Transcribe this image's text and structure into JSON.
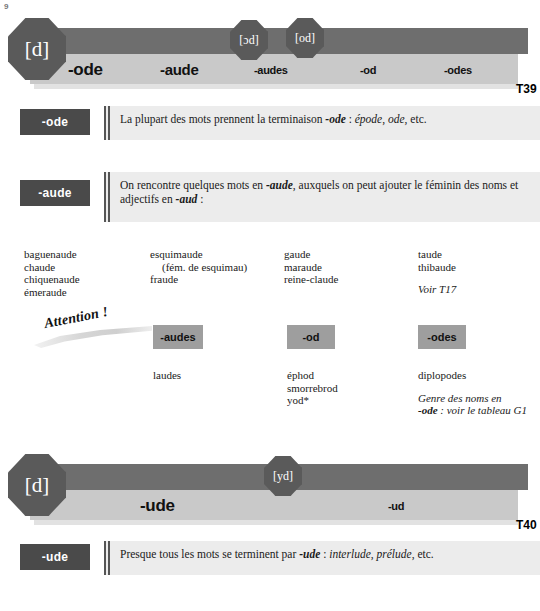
{
  "page_number": "9",
  "banners": [
    {
      "id": "T39",
      "label": "T39",
      "left_badge": "[d]",
      "badges": [
        "[ɔd]",
        "[od]"
      ],
      "codes": [
        "-ode",
        "-aude",
        "-audes",
        "-od",
        "-odes"
      ]
    },
    {
      "id": "T40",
      "label": "T40",
      "left_badge": "[d]",
      "badges": [
        "[yd]"
      ],
      "codes": [
        "-ude",
        "-ud"
      ]
    }
  ],
  "rules": [
    {
      "chip": "-ode",
      "text_parts": [
        {
          "t": "La plupart des mots prennent la terminaison ",
          "s": "normal"
        },
        {
          "t": "-ode",
          "s": "bold-italic"
        },
        {
          "t": " : ",
          "s": "normal"
        },
        {
          "t": "épode",
          "s": "italic"
        },
        {
          "t": ", ",
          "s": "normal"
        },
        {
          "t": "ode",
          "s": "italic"
        },
        {
          "t": ", etc.",
          "s": "normal"
        }
      ]
    },
    {
      "chip": "-aude",
      "text_parts": [
        {
          "t": "On rencontre quelques mots en ",
          "s": "normal"
        },
        {
          "t": "-aude",
          "s": "bold-italic"
        },
        {
          "t": ", auxquels on peut ajouter le féminin des noms et adjectifs en ",
          "s": "normal"
        },
        {
          "t": "-aud",
          "s": "bold-italic"
        },
        {
          "t": " :",
          "s": "normal"
        }
      ]
    },
    {
      "chip": "-ude",
      "text_parts": [
        {
          "t": "Presque tous les mots se terminent par ",
          "s": "normal"
        },
        {
          "t": "-ude",
          "s": "bold-italic"
        },
        {
          "t": " : ",
          "s": "normal"
        },
        {
          "t": "interlude",
          "s": "italic"
        },
        {
          "t": ", ",
          "s": "normal"
        },
        {
          "t": "prélude",
          "s": "italic"
        },
        {
          "t": ", etc.",
          "s": "normal"
        }
      ]
    }
  ],
  "aude_word_columns": [
    {
      "words": [
        "baguenaude",
        "chaude",
        "chiquenaude",
        "émeraude"
      ]
    },
    {
      "words": [
        "esquimaude",
        "(fém. de esquimau)",
        "fraude"
      ],
      "indent_index": 1
    },
    {
      "words": [
        "gaude",
        "maraude",
        "reine-claude"
      ]
    },
    {
      "words": [
        "taude",
        "thibaude"
      ],
      "note": "Voir T17"
    }
  ],
  "attention": {
    "label": "Attention !"
  },
  "exceptions": [
    {
      "tag": "-audes",
      "words": [
        "laudes"
      ]
    },
    {
      "tag": "-od",
      "words": [
        "éphod",
        "smorrebrod",
        "yod*"
      ]
    },
    {
      "tag": "-odes",
      "words": [
        "diplopodes"
      ],
      "note_line1": "Genre des noms en",
      "note_bold": "-ode",
      "note_line2": " : voir le tableau G1"
    }
  ]
}
